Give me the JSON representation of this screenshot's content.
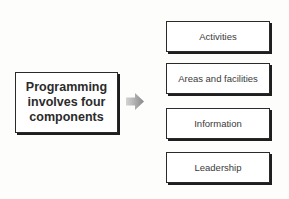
{
  "diagram": {
    "source": {
      "label": "Programming involves four components"
    },
    "connector": {
      "icon": "right-arrow-icon",
      "color_start": "#cfcfcf",
      "color_end": "#8a8a8a"
    },
    "components": [
      {
        "label": "Activities"
      },
      {
        "label": "Areas and facilities"
      },
      {
        "label": "Information"
      },
      {
        "label": "Leadership"
      }
    ]
  }
}
